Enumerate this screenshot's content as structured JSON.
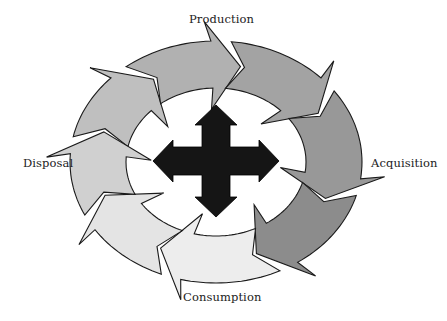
{
  "diagram": {
    "labels": {
      "top": "Production",
      "right": "Acquisition",
      "bottom": "Consumption",
      "left": "Disposal"
    },
    "ring": {
      "center": [
        216,
        162
      ],
      "outer_radii": [
        146,
        121
      ],
      "inner_radii": [
        90,
        74
      ],
      "stroke": "#1a1a1a"
    },
    "arrows": [
      {
        "name": "arrow-top-left",
        "start_deg": 192,
        "end_deg": 238,
        "fill": "#bfbfbf"
      },
      {
        "name": "arrow-top",
        "start_deg": 232,
        "end_deg": 282,
        "fill": "#b1b1b1"
      },
      {
        "name": "arrow-top-right",
        "start_deg": 276,
        "end_deg": 330,
        "fill": "#a3a3a3"
      },
      {
        "name": "arrow-right",
        "start_deg": 324,
        "end_deg": 22,
        "fill": "#989898"
      },
      {
        "name": "arrow-bottom-right",
        "start_deg": 16,
        "end_deg": 70,
        "fill": "#8c8c8c"
      },
      {
        "name": "arrow-bottom",
        "start_deg": 64,
        "end_deg": 118,
        "fill": "#ededed"
      },
      {
        "name": "arrow-bottom-left",
        "start_deg": 112,
        "end_deg": 160,
        "fill": "#e4e4e4"
      },
      {
        "name": "arrow-left",
        "start_deg": 154,
        "end_deg": 198,
        "fill": "#d0d0d0"
      }
    ],
    "center_icon": {
      "name": "four-way-arrow-icon",
      "fill": "#151515",
      "center": [
        216,
        161
      ]
    }
  }
}
